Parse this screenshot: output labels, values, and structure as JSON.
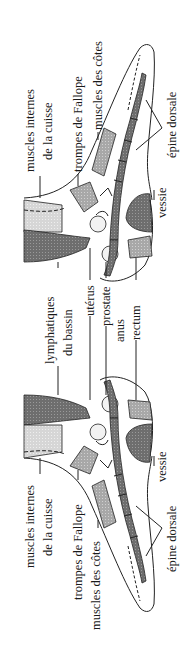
{
  "figure": {
    "orientation": "rotated-90-ccw",
    "colors": {
      "background": "#ffffff",
      "line": "#222222",
      "dark_fill": "#6a6a6a",
      "mid_fill": "#9a9a9a",
      "light_fill": "#c8c8c8",
      "spine_fill": "#7a7a7a"
    },
    "top_section": {
      "labels": {
        "thigh_muscles_line1": "muscles internes",
        "thigh_muscles_line2": "de la cuisse",
        "fallopian_tubes": "trompes de Fallope",
        "rib_muscles": "muscles des côtes",
        "spine": "épine dorsale",
        "bladder": "vessie"
      }
    },
    "middle_labels": {
      "pelvic_lymph_line1": "lymphatiques",
      "pelvic_lymph_line2": "du bassin",
      "uterus": "utérus",
      "prostate": "prostate",
      "anus": "anus",
      "rectum": "rectum"
    },
    "bottom_section": {
      "labels": {
        "thigh_muscles_line1": "muscles internes",
        "thigh_muscles_line2": "de la cuisse",
        "fallopian_tubes": "trompes de Fallope",
        "rib_muscles": "muscles des côtes",
        "spine": "épine dorsale",
        "bladder": "vessie"
      }
    }
  }
}
